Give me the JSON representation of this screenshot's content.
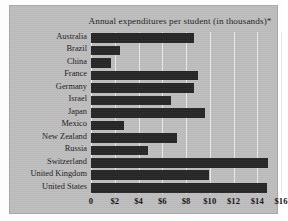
{
  "chart_data": {
    "type": "bar",
    "orientation": "horizontal",
    "title": "Annual expenditures per student (in thousands)*",
    "xlabel": "",
    "ylabel": "",
    "categories": [
      "Australia",
      "Brazil",
      "China",
      "France",
      "Germany",
      "Israel",
      "Japan",
      "Mexico",
      "New Zealand",
      "Russia",
      "Switzerland",
      "United Kingdom",
      "United States"
    ],
    "values": [
      8.7,
      2.4,
      1.7,
      9.0,
      8.7,
      6.7,
      9.6,
      2.8,
      7.2,
      4.8,
      14.9,
      9.9,
      14.8
    ],
    "xlim": [
      0,
      16
    ],
    "xticks": [
      0,
      2,
      4,
      6,
      8,
      10,
      12,
      14,
      16
    ],
    "xtick_labels": [
      "0",
      "$2",
      "$4",
      "$6",
      "$8",
      "$10",
      "$12",
      "$14",
      "$16"
    ],
    "grid": true,
    "legend": null,
    "bar_color": "#262626",
    "panel_color": "#bdbdbd",
    "gridline_color": "#e9e9e9"
  }
}
